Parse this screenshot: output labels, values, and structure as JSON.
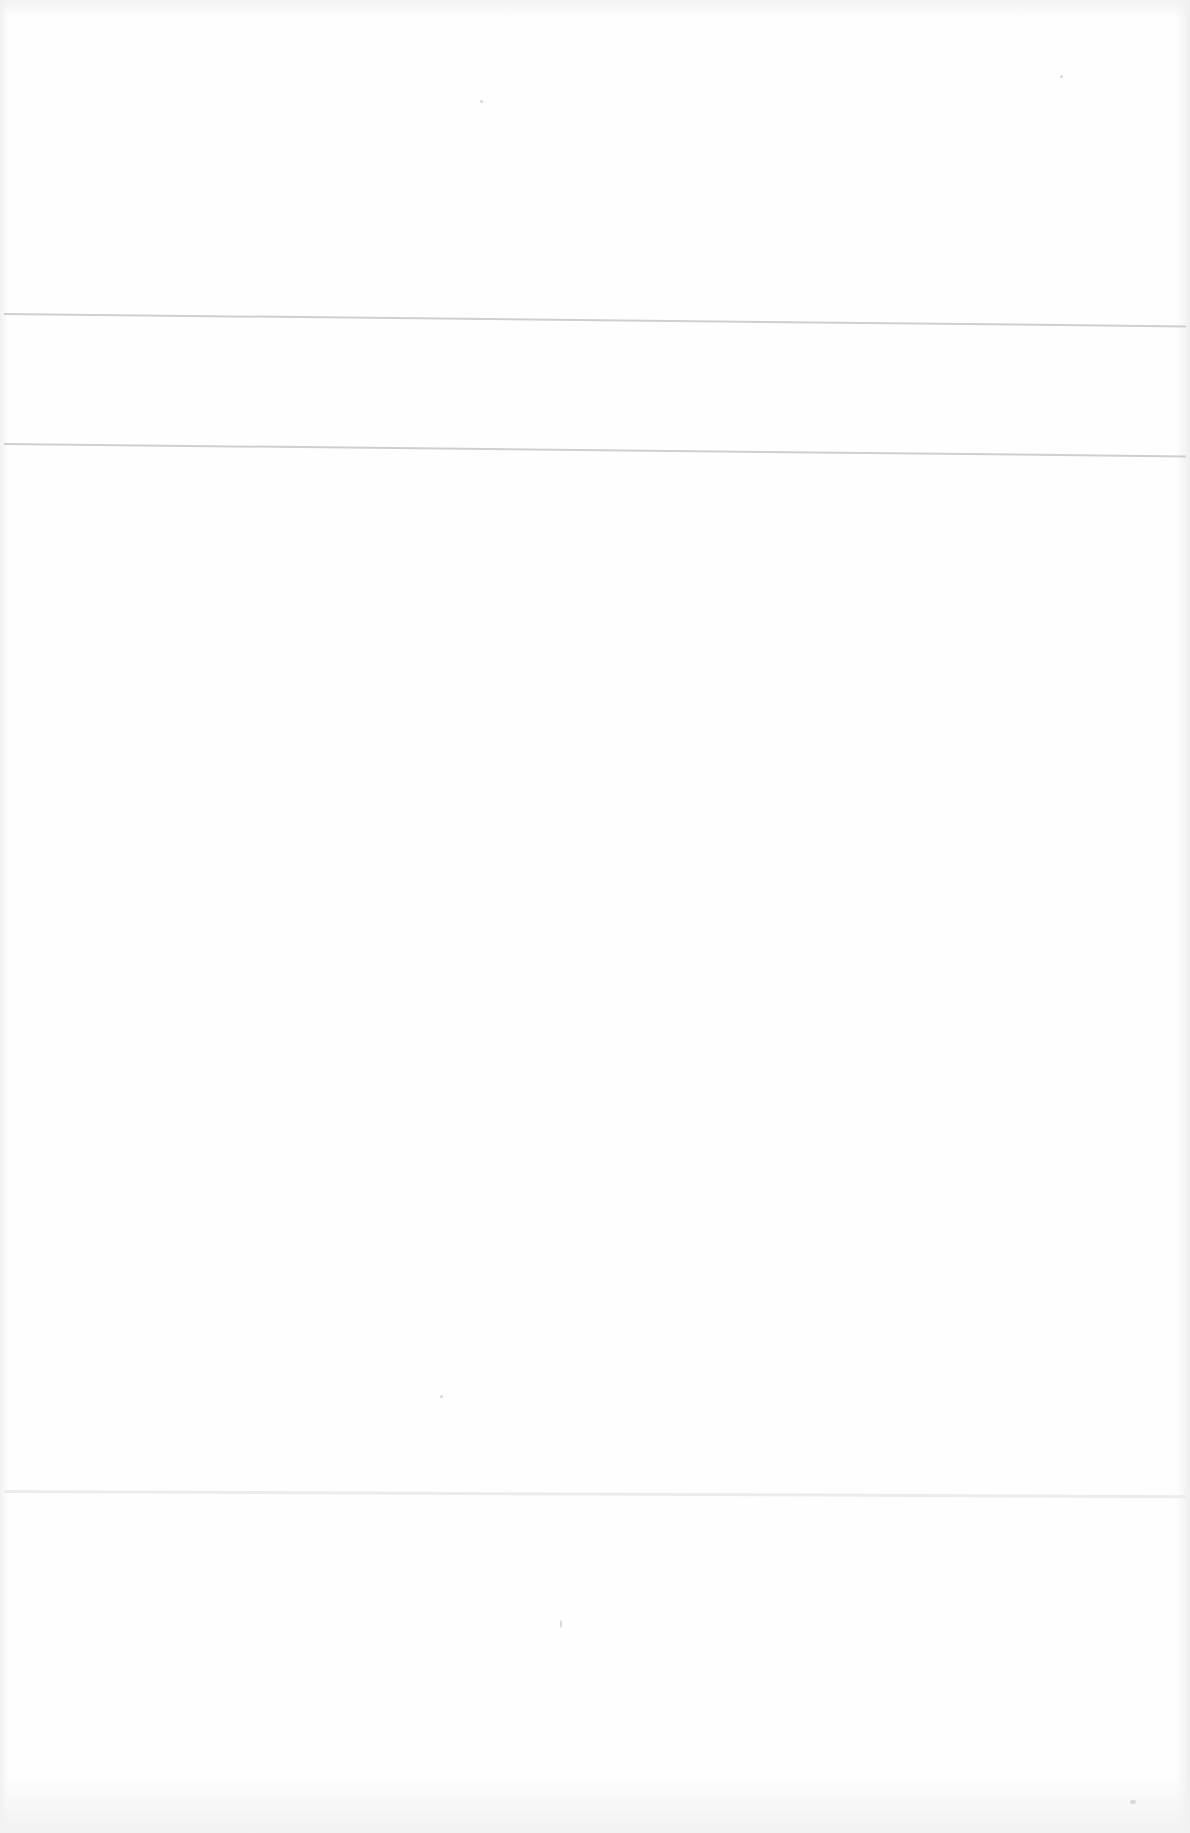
{
  "document": {
    "type": "scanned-blank-page",
    "rules": [
      {
        "id": "rule-1",
        "approx_y": 313
      },
      {
        "id": "rule-2",
        "approx_y": 443
      },
      {
        "id": "rule-3",
        "approx_y": 1490
      }
    ],
    "text_blocks": []
  }
}
